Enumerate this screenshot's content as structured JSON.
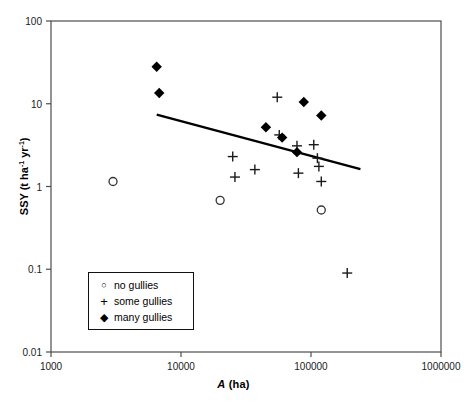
{
  "chart_data": {
    "type": "scatter",
    "title": "",
    "xlabel": "A (ha)",
    "ylabel": "SSY (t ha-1 yr-1)",
    "xscale": "log",
    "yscale": "log",
    "xlim": [
      1000,
      1000000
    ],
    "ylim": [
      0.01,
      100
    ],
    "grid": false,
    "legend_position": "lower-left-inside",
    "xticks": [
      {
        "value": 1000,
        "label": "1000"
      },
      {
        "value": 10000,
        "label": "10000"
      },
      {
        "value": 100000,
        "label": "100000"
      },
      {
        "value": 1000000,
        "label": "1000000"
      }
    ],
    "yticks": [
      {
        "value": 100,
        "label": "100"
      },
      {
        "value": 10,
        "label": "10"
      },
      {
        "value": 1,
        "label": "1"
      },
      {
        "value": 0.1,
        "label": "0.1"
      },
      {
        "value": 0.01,
        "label": "0.01"
      }
    ],
    "series": [
      {
        "name": "no gullies",
        "marker": "open-circle",
        "points": [
          {
            "x": 3000,
            "y": 1.15
          },
          {
            "x": 20000,
            "y": 0.68
          },
          {
            "x": 120000,
            "y": 0.52
          }
        ]
      },
      {
        "name": "some gullies",
        "marker": "plus",
        "points": [
          {
            "x": 25000,
            "y": 2.3
          },
          {
            "x": 26000,
            "y": 1.3
          },
          {
            "x": 37000,
            "y": 1.6
          },
          {
            "x": 55000,
            "y": 12.0
          },
          {
            "x": 57000,
            "y": 4.2
          },
          {
            "x": 78000,
            "y": 3.1
          },
          {
            "x": 80000,
            "y": 1.45
          },
          {
            "x": 105000,
            "y": 3.2
          },
          {
            "x": 112000,
            "y": 2.2
          },
          {
            "x": 115000,
            "y": 1.75
          },
          {
            "x": 120000,
            "y": 1.15
          },
          {
            "x": 190000,
            "y": 0.09
          }
        ]
      },
      {
        "name": "many gullies",
        "marker": "filled-diamond",
        "points": [
          {
            "x": 6500,
            "y": 28.0
          },
          {
            "x": 6800,
            "y": 13.5
          },
          {
            "x": 45000,
            "y": 5.2
          },
          {
            "x": 60000,
            "y": 3.9
          },
          {
            "x": 78000,
            "y": 2.6
          },
          {
            "x": 88000,
            "y": 10.5
          },
          {
            "x": 120000,
            "y": 7.2
          }
        ]
      }
    ],
    "trendline": {
      "name": "regression-line",
      "x_start": 6500,
      "y_start": 7.4,
      "x_end": 240000,
      "y_end": 1.62
    }
  },
  "legend": {
    "items": [
      {
        "marker_glyph": "○",
        "label": "no gullies"
      },
      {
        "marker_glyph": "+",
        "label": "some gullies"
      },
      {
        "marker_glyph": "◆",
        "label": "many gullies"
      }
    ]
  },
  "axis_titles": {
    "x_italic_part": "A",
    "x_rest": " (ha)",
    "y_prefix": "SSY (t ha",
    "y_sup1": "-1",
    "y_mid": " yr",
    "y_sup2": "-1",
    "y_suffix": ")"
  }
}
